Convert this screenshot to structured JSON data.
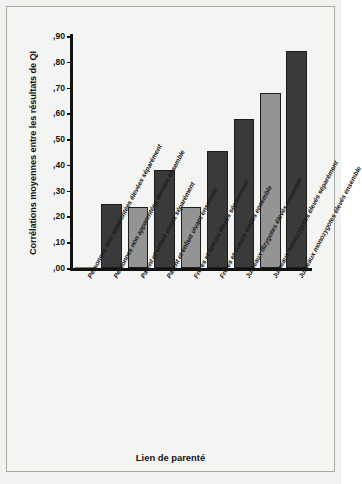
{
  "chart_data": {
    "type": "bar",
    "title": "",
    "xlabel": "Lien de parenté",
    "ylabel": "Corrélations moyennes entre les résultats de QI",
    "ylim": [
      0.0,
      0.9
    ],
    "ytick_labels": [
      ",90",
      ",80",
      ",70",
      ",60",
      ",50",
      ",40",
      ",30",
      ",20",
      ",10",
      ",00"
    ],
    "ytick_values": [
      0.9,
      0.8,
      0.7,
      0.6,
      0.5,
      0.4,
      0.3,
      0.2,
      0.1,
      0.0
    ],
    "grid": false,
    "legend": "none",
    "categories": [
      "Personnes non apparentées élevées séparément",
      "Personnes non apparentées élevées ensemble",
      "Parent et enfant vivant séparément",
      "Parent et enfant vivant ensemble",
      "Frères et soeurs élevés séparément",
      "Frères et soeurs élevés ensemble",
      "Jumeaux dizygotes élevés ensemble",
      "Jumeaux monozygotes élevés séparément",
      "Jumeaux monozygotes élevés ensemble"
    ],
    "values": [
      0.0,
      0.25,
      0.235,
      0.38,
      0.235,
      0.455,
      0.58,
      0.68,
      0.84
    ],
    "bar_shades": [
      "zero",
      "dark",
      "light",
      "dark",
      "light",
      "dark",
      "dark",
      "light",
      "dark"
    ],
    "colors": {
      "light_bar": "#949494",
      "dark_bar": "#3a3a3a",
      "bar_outline": "#1d1d1d",
      "axis": "#121212",
      "plot_background": "#f4f4f2",
      "frame_border": "#a8a8a4",
      "text": "#141414"
    }
  }
}
